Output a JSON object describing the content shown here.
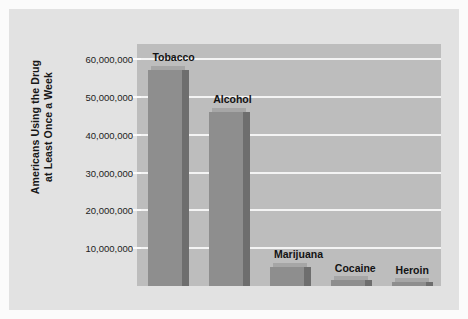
{
  "chart_data": {
    "type": "bar",
    "title": "",
    "xlabel": "",
    "ylabel": "Americans Using the Drug at Least Once a Week",
    "ylabel_line1": "Americans Using the Drug",
    "ylabel_line2": "at Least Once a Week",
    "categories": [
      "Tobacco",
      "Alcohol",
      "Marijuana",
      "Cocaine",
      "Heroin"
    ],
    "values": [
      57000000,
      46000000,
      5000000,
      1500000,
      1000000
    ],
    "ylim": [
      0,
      64000000
    ],
    "ytick_values": [
      10000000,
      20000000,
      30000000,
      40000000,
      50000000,
      60000000
    ],
    "ytick_labels": [
      "10,000,000",
      "20,000,000",
      "30,000,000",
      "40,000,000",
      "50,000,000",
      "60,000,000"
    ],
    "grid": true,
    "grid_color": "#f4f4f4",
    "legend": "none",
    "bar_color": "#8e8e8e",
    "bar_side_color": "#6e6e6e",
    "plot_background": "#bdbdbd",
    "panel_background": "#e2e2e2",
    "text_color": "#131313"
  }
}
